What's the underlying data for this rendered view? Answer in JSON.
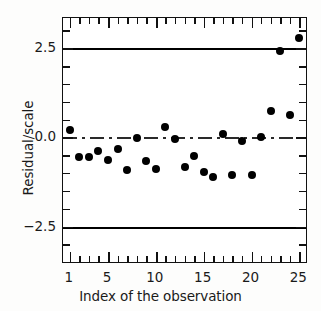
{
  "chart_data": {
    "type": "scatter",
    "title": "",
    "xlabel": "Index of the observation",
    "ylabel": "Residual/scale",
    "xlim": [
      0.3,
      25.9
    ],
    "ylim": [
      -3.55,
      3.35
    ],
    "grid": false,
    "legend": null,
    "x_ticks": [
      1,
      5,
      10,
      15,
      20,
      25
    ],
    "x_tick_labels": [
      "1",
      "5",
      "10",
      "15",
      "20",
      "25"
    ],
    "x_minor_ticks": [
      2,
      3,
      4,
      6,
      7,
      8,
      9,
      11,
      12,
      13,
      14,
      16,
      17,
      18,
      19,
      21,
      22,
      23,
      24
    ],
    "y_ticks": [
      -2.5,
      0.0,
      2.5
    ],
    "y_tick_labels": [
      "-2.5",
      "0.0",
      "2.5"
    ],
    "y_minor_ticks": [
      -3.0,
      -2.0,
      -1.5,
      -1.0,
      -0.5,
      0.5,
      1.0,
      1.5,
      2.0,
      3.0
    ],
    "reference_lines": [
      {
        "name": "upper-cutoff",
        "y": 2.5,
        "style": "solid",
        "width": "bold",
        "color": "#000000"
      },
      {
        "name": "zero-line",
        "y": 0.0,
        "style": "dash-dot",
        "width": "thin",
        "color": "#2a2a2a"
      },
      {
        "name": "lower-cutoff",
        "y": -2.5,
        "style": "solid",
        "width": "bold",
        "color": "#000000"
      }
    ],
    "marker": {
      "shape": "circle",
      "filled": true,
      "color": "#000000",
      "size_px": 8
    },
    "x": [
      1,
      2,
      3,
      4,
      5,
      6,
      7,
      8,
      9,
      10,
      11,
      12,
      13,
      14,
      15,
      16,
      17,
      18,
      19,
      20,
      21,
      22,
      23,
      24,
      25
    ],
    "y": [
      0.22,
      -0.55,
      -0.55,
      -0.38,
      -0.62,
      -0.33,
      -0.92,
      -0.02,
      -0.65,
      -0.88,
      0.3,
      -0.05,
      -0.82,
      -0.52,
      -0.98,
      -1.1,
      0.1,
      -1.05,
      -0.1,
      -1.05,
      0.02,
      0.75,
      2.43,
      0.62,
      2.78
    ],
    "series": [
      {
        "name": "Residual/scale",
        "values": [
          0.22,
          -0.55,
          -0.55,
          -0.38,
          -0.62,
          -0.33,
          -0.92,
          -0.02,
          -0.65,
          -0.88,
          0.3,
          -0.05,
          -0.82,
          -0.52,
          -0.98,
          -1.1,
          0.1,
          -1.05,
          -0.1,
          -1.05,
          0.02,
          0.75,
          2.43,
          0.62,
          2.78
        ]
      }
    ],
    "annotations": []
  },
  "axis_titles": {
    "x": "Index of the observation",
    "y": "Residual/scale"
  }
}
